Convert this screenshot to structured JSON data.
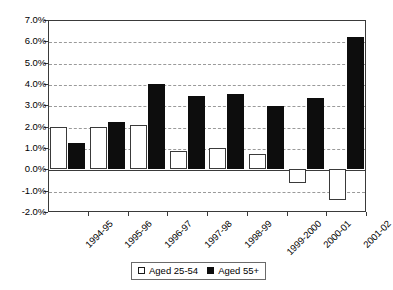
{
  "chart_data": {
    "type": "bar",
    "title": "",
    "subtitle": "",
    "xlabel": "",
    "ylabel": "",
    "ylim": [
      -2.0,
      7.0
    ],
    "y_tick_step": 1.0,
    "y_tick_labels": [
      "7.0%",
      "6.0%",
      "5.0%",
      "4.0%",
      "3.0%",
      "2.0%",
      "1.0%",
      "0.0%",
      "-1.0%",
      "-2.0%"
    ],
    "y_tick_values": [
      7.0,
      6.0,
      5.0,
      4.0,
      3.0,
      2.0,
      1.0,
      0.0,
      -1.0,
      -2.0
    ],
    "grid": true,
    "grid_style": "dashed-horizontal",
    "legend_position": "bottom-center",
    "categories": [
      "1994-95",
      "1995-96",
      "1996-97",
      "1997-98",
      "1998-99",
      "1999-2000",
      "2000-01",
      "2001-02"
    ],
    "series": [
      {
        "name": "Aged 25-54",
        "color": "#ffffff",
        "edge_color": "#3a3a3a",
        "values": [
          2.0,
          2.0,
          2.1,
          0.85,
          1.0,
          0.7,
          -0.65,
          -1.45
        ]
      },
      {
        "name": "Aged 55+",
        "color": "#0d0d0d",
        "edge_color": "#0d0d0d",
        "values": [
          1.25,
          2.2,
          4.0,
          3.45,
          3.55,
          2.95,
          3.35,
          6.2
        ]
      }
    ]
  },
  "legend": {
    "entries": [
      {
        "label": "Aged 25-54",
        "swatch": "hollow-square-icon"
      },
      {
        "label": "Aged 55+",
        "swatch": "filled-square-icon"
      }
    ]
  }
}
